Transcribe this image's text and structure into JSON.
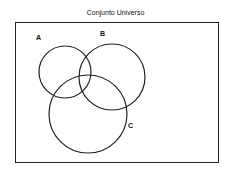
{
  "diagram": {
    "title": "Conjunto Universo",
    "sets": [
      {
        "label": "A"
      },
      {
        "label": "B"
      },
      {
        "label": "C"
      }
    ]
  }
}
